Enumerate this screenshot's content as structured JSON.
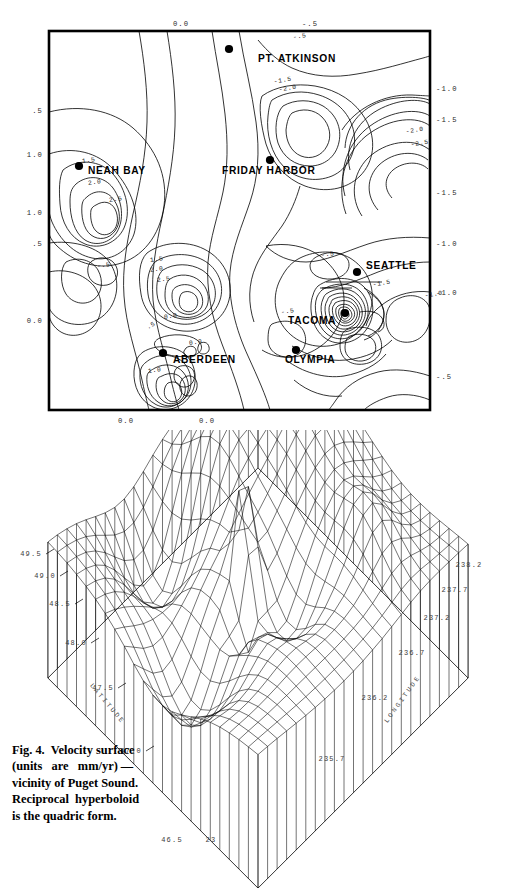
{
  "figure": {
    "number": "Fig. 4.",
    "caption_lines": [
      "Fig. 4.  Velocity surface",
      "(units   are   mm/yr) —",
      "vicinity of Puget Sound.",
      "Reciprocal  hyperboloid",
      "is the quadric form."
    ],
    "caption_full": "Fig. 4. Velocity surface (units are mm/yr) — vicinity of Puget Sound. Reciprocal hyperboloid is the quadric form.",
    "units": "mm/yr",
    "region": "Puget Sound",
    "quadric_form": "Reciprocal hyperboloid"
  },
  "contour_map": {
    "type": "contour",
    "title": "",
    "cities": [
      {
        "name": "PT. ATKINSON",
        "label_x": 258,
        "label_y": 62,
        "dot_x": 229,
        "dot_y": 49,
        "anchor": "start"
      },
      {
        "name": "NEAH BAY",
        "label_x": 88,
        "label_y": 174,
        "dot_x": 79,
        "dot_y": 166,
        "anchor": "start"
      },
      {
        "name": "FRIDAY HARBOR",
        "label_x": 222,
        "label_y": 174,
        "dot_x": 270,
        "dot_y": 160,
        "anchor": "start"
      },
      {
        "name": "SEATTLE",
        "label_x": 366,
        "label_y": 269,
        "dot_x": 357,
        "dot_y": 272,
        "anchor": "start"
      },
      {
        "name": "TACOMA",
        "label_x": 288,
        "label_y": 324,
        "dot_x": 345,
        "dot_y": 313,
        "anchor": "start"
      },
      {
        "name": "ABERDEEN",
        "label_x": 173,
        "label_y": 363,
        "dot_x": 163,
        "dot_y": 353,
        "anchor": "start"
      },
      {
        "name": "OLYMPIA",
        "label_x": 285,
        "label_y": 363,
        "dot_x": 296,
        "dot_y": 350,
        "anchor": "start"
      }
    ],
    "axis_labels": {
      "top": [
        {
          "text": "0.0",
          "x": 181
        },
        {
          "text": "-.5",
          "x": 310
        }
      ],
      "bottom": [
        {
          "text": "0.0",
          "x": 126
        },
        {
          "text": "0.0",
          "x": 207
        }
      ],
      "left": [
        {
          "text": ".5",
          "y": 110
        },
        {
          "text": "1.0",
          "y": 154
        },
        {
          "text": "1.0",
          "y": 212
        },
        {
          "text": ".5",
          "y": 243
        },
        {
          "text": "0.0",
          "y": 320
        }
      ],
      "right": [
        {
          "text": "-1.0",
          "y": 88
        },
        {
          "text": "-1.5",
          "y": 119
        },
        {
          "text": "-1.5",
          "y": 192
        },
        {
          "text": "-1.0",
          "y": 243
        },
        {
          "text": "-1.0",
          "y": 292
        },
        {
          "text": "-.5",
          "y": 376
        }
      ]
    },
    "contour_levels": [
      -2.5,
      -2.0,
      -1.5,
      -1.0,
      -0.5,
      0.0,
      0.5,
      1.0,
      1.5,
      2.0,
      2.5,
      3.0
    ],
    "inline_labels": [
      {
        "text": "1.5",
        "x": 89,
        "y": 162,
        "rot": -8
      },
      {
        "text": "2.0",
        "x": 95,
        "y": 184,
        "rot": -8
      },
      {
        "text": "2.5",
        "x": 116,
        "y": 201,
        "rot": -8
      },
      {
        "text": "1.5",
        "x": 157,
        "y": 261,
        "rot": -8
      },
      {
        "text": "2.0",
        "x": 157,
        "y": 271,
        "rot": -8
      },
      {
        "text": "2.5",
        "x": 164,
        "y": 281,
        "rot": -8
      },
      {
        "text": "-.5",
        "x": 104,
        "y": 267,
        "rot": -8
      },
      {
        "text": "0.0",
        "x": 171,
        "y": 318,
        "rot": -8
      },
      {
        "text": ".5",
        "x": 152,
        "y": 327,
        "rot": -30
      },
      {
        "text": "1.0",
        "x": 155,
        "y": 372,
        "rot": -8
      },
      {
        "text": "0.0",
        "x": 196,
        "y": 344,
        "rot": -8
      },
      {
        "text": "-.5",
        "x": 300,
        "y": 38,
        "rot": -8
      },
      {
        "text": "-1.5",
        "x": 283,
        "y": 82,
        "rot": -8
      },
      {
        "text": "-2.0",
        "x": 288,
        "y": 90,
        "rot": -8
      },
      {
        "text": "-2.0",
        "x": 415,
        "y": 132,
        "rot": -8
      },
      {
        "text": "-2.5",
        "x": 420,
        "y": 145,
        "rot": -8
      },
      {
        "text": "-.5",
        "x": 328,
        "y": 256,
        "rot": -8
      },
      {
        "text": "-1.5",
        "x": 382,
        "y": 285,
        "rot": -8
      },
      {
        "text": "-1.0",
        "x": 434,
        "y": 296,
        "rot": -8
      },
      {
        "text": "-.5",
        "x": 288,
        "y": 313,
        "rot": -8
      }
    ]
  },
  "surface_plot": {
    "type": "surface",
    "mesh": "wireframe",
    "axes": {
      "x": {
        "name": "LATITUDE",
        "ticks": [
          "49.5",
          "49.0",
          "48.5",
          "48.0",
          "47.5",
          "47.0",
          "46.5"
        ]
      },
      "y": {
        "name": "LONGITUDE",
        "ticks": [
          "238.2",
          "237.7",
          "237.2",
          "236.7",
          "236.2",
          "235.7"
        ]
      },
      "corner_tick": "23"
    },
    "latitude_ticks": [
      {
        "text": "49.5",
        "x": 31,
        "y": 556
      },
      {
        "text": "49.0",
        "x": 45,
        "y": 578
      },
      {
        "text": "48.5",
        "x": 60,
        "y": 606
      },
      {
        "text": "48.0",
        "x": 76,
        "y": 645
      },
      {
        "text": "47.5",
        "x": 103,
        "y": 690
      },
      {
        "text": "47.0",
        "x": 131,
        "y": 753
      },
      {
        "text": "46.5",
        "x": 172,
        "y": 842
      }
    ],
    "longitude_ticks": [
      {
        "text": "238.2",
        "x": 469,
        "y": 567
      },
      {
        "text": "237.7",
        "x": 455,
        "y": 592
      },
      {
        "text": "237.2",
        "x": 437,
        "y": 620
      },
      {
        "text": "236.7",
        "x": 412,
        "y": 655
      },
      {
        "text": "236.2",
        "x": 375,
        "y": 700
      },
      {
        "text": "235.7",
        "x": 332,
        "y": 761
      },
      {
        "text": "23",
        "x": 211,
        "y": 842
      }
    ],
    "axis_name_latitude": {
      "text": "LATITUDE",
      "x": 106,
      "y": 705,
      "rot": 50
    },
    "axis_name_longitude": {
      "text": "LONGITUDE",
      "x": 404,
      "y": 700,
      "rot": -54
    }
  }
}
